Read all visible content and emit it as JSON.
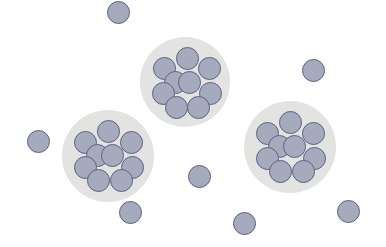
{
  "colors": {
    "background": "#ffffff",
    "halo": "#e3e3e1",
    "halo_edge": "#ececea",
    "particle_fill": "#a5abbd",
    "particle_stroke": "#5c6280"
  },
  "particle_radius": 11.5,
  "clusters": [
    {
      "name": "cluster-top",
      "cx": 185,
      "cy": 82,
      "halo_radius": 45,
      "members": [
        {
          "dx": 2,
          "dy": -24
        },
        {
          "dx": -21,
          "dy": -14
        },
        {
          "dx": 24,
          "dy": -14
        },
        {
          "dx": -10,
          "dy": 0
        },
        {
          "dx": 4,
          "dy": 0
        },
        {
          "dx": -22,
          "dy": 11
        },
        {
          "dx": 25,
          "dy": 11
        },
        {
          "dx": -9,
          "dy": 25
        },
        {
          "dx": 13,
          "dy": 25
        }
      ]
    },
    {
      "name": "cluster-left",
      "cx": 108,
      "cy": 156,
      "halo_radius": 46,
      "members": [
        {
          "dx": 0,
          "dy": -25
        },
        {
          "dx": -23,
          "dy": -14
        },
        {
          "dx": 23,
          "dy": -14
        },
        {
          "dx": -11,
          "dy": -1
        },
        {
          "dx": 4,
          "dy": -1
        },
        {
          "dx": -23,
          "dy": 11
        },
        {
          "dx": 24,
          "dy": 11
        },
        {
          "dx": -10,
          "dy": 24
        },
        {
          "dx": 13,
          "dy": 24
        }
      ]
    },
    {
      "name": "cluster-right",
      "cx": 290,
      "cy": 147,
      "halo_radius": 46,
      "members": [
        {
          "dx": 0,
          "dy": -25
        },
        {
          "dx": -23,
          "dy": -14
        },
        {
          "dx": 23,
          "dy": -14
        },
        {
          "dx": -11,
          "dy": -1
        },
        {
          "dx": 4,
          "dy": -1
        },
        {
          "dx": -23,
          "dy": 11
        },
        {
          "dx": 24,
          "dy": 11
        },
        {
          "dx": -10,
          "dy": 24
        },
        {
          "dx": 13,
          "dy": 24
        }
      ]
    }
  ],
  "free_particles": [
    {
      "x": 118,
      "y": 12
    },
    {
      "x": 38,
      "y": 141
    },
    {
      "x": 313,
      "y": 70
    },
    {
      "x": 199,
      "y": 176
    },
    {
      "x": 130,
      "y": 212
    },
    {
      "x": 244,
      "y": 223
    },
    {
      "x": 348,
      "y": 211
    }
  ]
}
